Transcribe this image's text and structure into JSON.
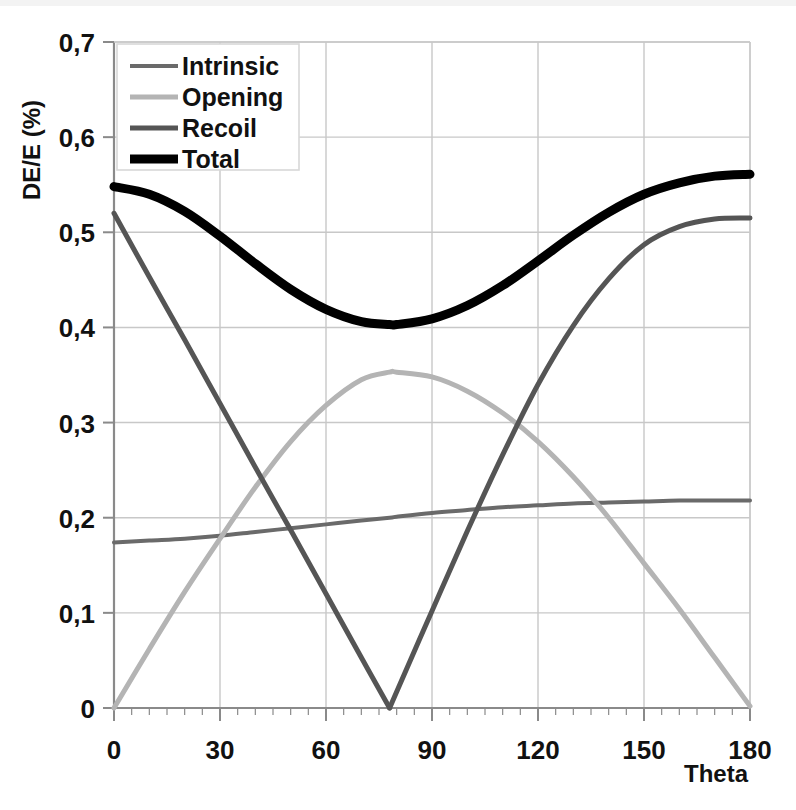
{
  "chart_data": {
    "type": "line",
    "title": "",
    "xlabel": "Theta",
    "ylabel": "DE/E (%)",
    "xlim": [
      0,
      180
    ],
    "ylim": [
      0,
      0.7
    ],
    "xticks": [
      "0",
      "30",
      "60",
      "90",
      "120",
      "150",
      "180"
    ],
    "xtick_values": [
      0,
      30,
      60,
      90,
      120,
      150,
      180
    ],
    "yticks": [
      "0",
      "0,1",
      "0,2",
      "0,3",
      "0,4",
      "0,5",
      "0,6",
      "0,7"
    ],
    "ytick_values": [
      0,
      0.1,
      0.2,
      0.3,
      0.4,
      0.5,
      0.6,
      0.7
    ],
    "grid": true,
    "legend_position": "top-left",
    "decimal_separator": ",",
    "x": [
      0,
      10,
      20,
      30,
      40,
      50,
      60,
      70,
      78,
      80,
      90,
      100,
      110,
      120,
      130,
      140,
      150,
      160,
      170,
      180
    ],
    "series": [
      {
        "name": "Intrinsic",
        "color": "#6a6a6a",
        "width": 4,
        "values": [
          0.174,
          0.176,
          0.178,
          0.181,
          0.185,
          0.189,
          0.193,
          0.197,
          0.2,
          0.201,
          0.205,
          0.208,
          0.211,
          0.213,
          0.215,
          0.216,
          0.217,
          0.218,
          0.218,
          0.218
        ]
      },
      {
        "name": "Opening",
        "color": "#b4b4b4",
        "width": 5,
        "values": [
          0.0,
          0.062,
          0.122,
          0.178,
          0.232,
          0.28,
          0.318,
          0.345,
          0.353,
          0.353,
          0.348,
          0.333,
          0.31,
          0.28,
          0.243,
          0.2,
          0.152,
          0.104,
          0.053,
          0.002
        ]
      },
      {
        "name": "Recoil",
        "color": "#555555",
        "width": 5,
        "values": [
          0.52,
          0.453,
          0.387,
          0.32,
          0.253,
          0.187,
          0.12,
          0.053,
          0.0,
          0.017,
          0.102,
          0.186,
          0.266,
          0.34,
          0.402,
          0.451,
          0.487,
          0.506,
          0.514,
          0.515
        ]
      },
      {
        "name": "Total",
        "color": "#000000",
        "width": 9,
        "values": [
          0.548,
          0.54,
          0.522,
          0.496,
          0.467,
          0.44,
          0.419,
          0.406,
          0.403,
          0.403,
          0.409,
          0.423,
          0.444,
          0.47,
          0.497,
          0.521,
          0.54,
          0.552,
          0.559,
          0.561
        ]
      }
    ]
  },
  "legend": {
    "items": [
      {
        "label": "Intrinsic"
      },
      {
        "label": "Opening"
      },
      {
        "label": "Recoil"
      },
      {
        "label": "Total"
      }
    ]
  },
  "axes": {
    "y_title": "DE/E (%)",
    "x_title": "Theta"
  },
  "colors": {
    "intrinsic": "#6a6a6a",
    "opening": "#b4b4b4",
    "recoil": "#555555",
    "total": "#000000",
    "grid": "#c8c8c8",
    "axis": "#808080",
    "background": "#ffffff"
  }
}
